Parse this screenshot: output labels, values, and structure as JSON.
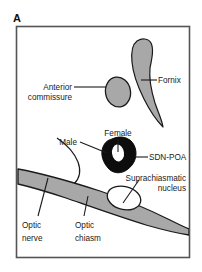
{
  "figure": {
    "panel_letter": "A",
    "frame_color": "#555555",
    "background_color": "#ffffff"
  },
  "colors": {
    "gray_fill": "#a8a8a8",
    "black_fill": "#0d0d0d",
    "white_fill": "#ffffff",
    "outline": "#1a1a1a",
    "text": "#1a1a1a"
  },
  "labels": {
    "fornix": "Fornix",
    "anterior_commissure_line1": "Anterior",
    "anterior_commissure_line2": "commissure",
    "female": "Female",
    "male": "Male",
    "sdn_poa": "SDN-POA",
    "suprachiasmatic_line1": "Suprachiasmatic",
    "suprachiasmatic_line2": "nucleus",
    "optic_nerve_line1": "Optic",
    "optic_nerve_line2": "nerve",
    "optic_chiasm_line1": "Optic",
    "optic_chiasm_line2": "chiasm"
  },
  "structures": [
    {
      "name": "fornix",
      "fill": "gray",
      "label": "Fornix"
    },
    {
      "name": "anterior-commissure",
      "fill": "gray",
      "label": "Anterior commissure"
    },
    {
      "name": "sdn-poa",
      "fill": "black",
      "label": "SDN-POA"
    },
    {
      "name": "sdn-poa-female-core",
      "fill": "white",
      "label": "Female"
    },
    {
      "name": "suprachiasmatic-nucleus",
      "fill": "white",
      "label": "Suprachiasmatic nucleus"
    },
    {
      "name": "optic-chiasm-band",
      "fill": "gray",
      "label": "Optic chiasm"
    },
    {
      "name": "optic-nerve",
      "fill": "gray",
      "label": "Optic nerve"
    }
  ]
}
